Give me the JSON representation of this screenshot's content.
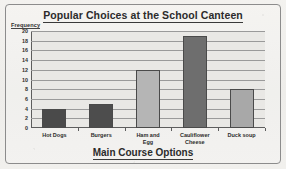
{
  "chart_data": {
    "type": "bar",
    "title": "Popular Choices at the School Canteen",
    "xlabel": "Main Course Options",
    "ylabel": "Frequency",
    "categories": [
      "Hot Dogs",
      "Burgers",
      "Ham and Egg",
      "Cauliflower Cheese",
      "Duck soup"
    ],
    "values": [
      4,
      5,
      12,
      19,
      8
    ],
    "bar_colors": [
      "#4a4a4a",
      "#4d4d4d",
      "#b5b5b5",
      "#6e6e6e",
      "#a8a8a8"
    ],
    "ylim": [
      0,
      20
    ],
    "ytick_step": 2,
    "yticks": [
      0,
      2,
      4,
      6,
      8,
      10,
      12,
      14,
      16,
      18,
      20
    ],
    "ytick_labels": [
      "0",
      "2",
      "4",
      "6",
      "8",
      "10",
      "12",
      "14",
      "16",
      "18",
      "20"
    ],
    "grid": true,
    "legend": false,
    "legend_position": "none"
  },
  "figure": {
    "background_color": "#f0efec",
    "plot_background_color": "#e9e8e5",
    "axis_color": "#5d5d5d",
    "grid_color": "#9a9a9a",
    "frame_color": "#8c8c8c"
  }
}
